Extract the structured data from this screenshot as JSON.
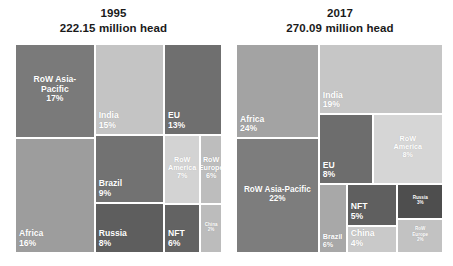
{
  "chart_data": {
    "type": "treemap",
    "title": "",
    "unit": "million head",
    "panels": [
      {
        "year": "1995",
        "subtitle": "222.15 million head",
        "total": 222.15,
        "categories": [
          "RoW Asia-Pacific",
          "Africa",
          "India",
          "EU",
          "Brazil",
          "Russia",
          "RoW America",
          "RoW Europe",
          "NFT",
          "China"
        ],
        "values": [
          17,
          16,
          15,
          13,
          9,
          8,
          7,
          6,
          6,
          2
        ],
        "nodes": [
          {
            "label": "RoW Asia-\nPacific",
            "pct": "17%",
            "color": "#7a7a7a",
            "x": 0.0,
            "y": 0.0,
            "w": 0.385,
            "h": 0.45,
            "align": "center",
            "size": "sz-lg"
          },
          {
            "label": "Africa",
            "pct": "16%",
            "color": "#9d9d9d",
            "x": 0.0,
            "y": 0.45,
            "w": 0.385,
            "h": 0.55,
            "align": "left",
            "size": "sz-lg"
          },
          {
            "label": "India",
            "pct": "15%",
            "color": "#c4c4c4",
            "x": 0.385,
            "y": 0.0,
            "w": 0.335,
            "h": 0.435,
            "align": "left",
            "size": "sz-lg"
          },
          {
            "label": "EU",
            "pct": "13%",
            "color": "#6f6f6f",
            "x": 0.72,
            "y": 0.0,
            "w": 0.28,
            "h": 0.435,
            "align": "left",
            "size": "sz-lg"
          },
          {
            "label": "Brazil",
            "pct": "9%",
            "color": "#727272",
            "x": 0.385,
            "y": 0.435,
            "w": 0.335,
            "h": 0.325,
            "align": "left",
            "size": "sz-lg"
          },
          {
            "label": "Russia",
            "pct": "8%",
            "color": "#5e5e5e",
            "x": 0.385,
            "y": 0.76,
            "w": 0.335,
            "h": 0.24,
            "align": "left",
            "size": "sz-lg"
          },
          {
            "label": "RoW\nAmerica",
            "pct": "7%",
            "color": "#d3d3d3",
            "x": 0.72,
            "y": 0.435,
            "w": 0.175,
            "h": 0.33,
            "align": "center",
            "size": "sz-sm"
          },
          {
            "label": "RoW\nEurope",
            "pct": "6%",
            "color": "#bdbdbd",
            "x": 0.895,
            "y": 0.435,
            "w": 0.105,
            "h": 0.33,
            "align": "center",
            "size": "sz-sm"
          },
          {
            "label": "NFT",
            "pct": "6%",
            "color": "#636363",
            "x": 0.72,
            "y": 0.765,
            "w": 0.175,
            "h": 0.235,
            "align": "left",
            "size": "sz-lg"
          },
          {
            "label": "China",
            "pct": "2%",
            "color": "#bcbcbc",
            "x": 0.895,
            "y": 0.765,
            "w": 0.105,
            "h": 0.235,
            "align": "center",
            "size": "sz-xs"
          }
        ]
      },
      {
        "year": "2017",
        "subtitle": "270.09 million head",
        "total": 270.09,
        "categories": [
          "Africa",
          "RoW Asia-Pacific",
          "India",
          "EU",
          "RoW America",
          "Brazil",
          "NFT",
          "China",
          "Russia",
          "RoW Europe"
        ],
        "values": [
          24,
          22,
          19,
          8,
          8,
          6,
          5,
          4,
          3,
          2
        ],
        "nodes": [
          {
            "label": "Africa",
            "pct": "24%",
            "color": "#a3a3a3",
            "x": 0.0,
            "y": 0.0,
            "w": 0.4,
            "h": 0.45,
            "align": "left",
            "size": "sz-lg"
          },
          {
            "label": "RoW Asia-Pacific",
            "pct": "22%",
            "color": "#7d7d7d",
            "x": 0.0,
            "y": 0.45,
            "w": 0.4,
            "h": 0.55,
            "align": "center",
            "size": "sz-md"
          },
          {
            "label": "India",
            "pct": "19%",
            "color": "#c6c6c6",
            "x": 0.4,
            "y": 0.0,
            "w": 0.6,
            "h": 0.335,
            "align": "left",
            "size": "sz-lg"
          },
          {
            "label": "EU",
            "pct": "8%",
            "color": "#6d6d6d",
            "x": 0.4,
            "y": 0.335,
            "w": 0.26,
            "h": 0.335,
            "align": "left",
            "size": "sz-lg"
          },
          {
            "label": "RoW\nAmerica",
            "pct": "8%",
            "color": "#d6d6d6",
            "x": 0.66,
            "y": 0.335,
            "w": 0.34,
            "h": 0.335,
            "align": "center",
            "size": "sz-sm"
          },
          {
            "label": "Brazil",
            "pct": "6%",
            "color": "#a8a8a8",
            "x": 0.4,
            "y": 0.67,
            "w": 0.135,
            "h": 0.33,
            "align": "left",
            "size": "sz-sm"
          },
          {
            "label": "NFT",
            "pct": "5%",
            "color": "#5f5f5f",
            "x": 0.535,
            "y": 0.67,
            "w": 0.245,
            "h": 0.2,
            "align": "left",
            "size": "sz-lg"
          },
          {
            "label": "China",
            "pct": "4%",
            "color": "#c9c9c9",
            "x": 0.535,
            "y": 0.87,
            "w": 0.245,
            "h": 0.13,
            "align": "left",
            "size": "sz-lg"
          },
          {
            "label": "Russia",
            "pct": "3%",
            "color": "#4e4e4e",
            "x": 0.78,
            "y": 0.67,
            "w": 0.22,
            "h": 0.165,
            "align": "center",
            "size": "sz-xs"
          },
          {
            "label": "RoW\nEurope",
            "pct": "2%",
            "color": "#c2c2c2",
            "x": 0.78,
            "y": 0.835,
            "w": 0.22,
            "h": 0.165,
            "align": "center",
            "size": "sz-xs"
          }
        ]
      }
    ]
  },
  "layout": {
    "panel_geom": [
      {
        "left": 0,
        "width": 227,
        "map_left": 15,
        "map_top": 44,
        "map_width": 207,
        "map_height": 209
      },
      {
        "left": 227,
        "width": 226,
        "map_left": 9,
        "map_top": 44,
        "map_width": 207,
        "map_height": 209
      }
    ]
  }
}
